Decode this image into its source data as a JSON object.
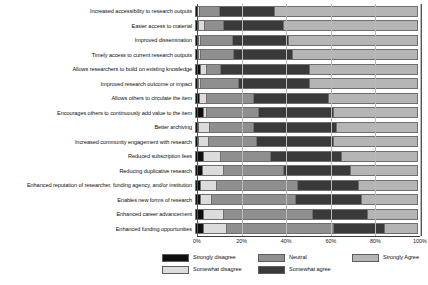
{
  "chart_data": {
    "type": "bar",
    "subtype": "stacked-horizontal-100pct",
    "title": "",
    "subtitle": "",
    "xlabel": "",
    "ylabel": "",
    "xlim": [
      0,
      100
    ],
    "xticks": [
      "0%",
      "20%",
      "40%",
      "60%",
      "80%",
      "100%"
    ],
    "xtick_values": [
      0,
      20,
      40,
      60,
      80,
      100
    ],
    "grid": true,
    "legend_position": "bottom",
    "categories": [
      "Increased accessibility to research outputs",
      "Easier access to material",
      "Improved dissemination",
      "Timely access to current research outputs",
      "Allows researchers to build on existing knowledge",
      "Improved research outcome or impact",
      "Allows others to circulate the item",
      "Encourages others to continuously add value to the item",
      "Better archiving",
      "Increased community engagement with research",
      "Reduced subscription fees",
      "Reducing duplicative research",
      "Enhanced reputation of researcher, funding agency, and/or institution",
      "Enables new forms of research",
      "Enhanced career advancement",
      "Enhanced funding opportunities"
    ],
    "series": [
      {
        "name": "Strongly disagree",
        "color": "#0f0f0f",
        "values": [
          0.5,
          1.0,
          0.8,
          0.8,
          2.0,
          1.0,
          1.2,
          3.0,
          1.0,
          1.0,
          3.2,
          2.5,
          2.0,
          2.0,
          3.0,
          3.0
        ]
      },
      {
        "name": "Somewhat disagree",
        "color": "#dcdcdc",
        "values": [
          0.7,
          2.5,
          1.0,
          1.0,
          2.5,
          1.0,
          3.5,
          1.5,
          5.0,
          4.5,
          7.5,
          9.5,
          7.0,
          5.0,
          9.0,
          10.5
        ]
      },
      {
        "name": "Neutral",
        "color": "#8f8f8f",
        "values": [
          9.0,
          8.5,
          14.5,
          15.0,
          6.5,
          17.0,
          21.0,
          23.5,
          20.0,
          21.5,
          23.0,
          27.5,
          36.5,
          38.0,
          40.5,
          48.5
        ]
      },
      {
        "name": "Somewhat agree",
        "color": "#3a3a3a",
        "values": [
          25.0,
          27.5,
          25.5,
          26.5,
          40.0,
          32.0,
          34.0,
          34.0,
          37.5,
          35.0,
          32.0,
          30.0,
          28.0,
          29.5,
          25.0,
          23.0
        ]
      },
      {
        "name": "Strongly Agree",
        "color": "#b5b5b5",
        "values": [
          64.8,
          60.5,
          58.2,
          56.7,
          49.0,
          49.0,
          40.3,
          38.0,
          36.5,
          38.0,
          34.3,
          30.5,
          26.5,
          25.5,
          22.5,
          15.0
        ]
      }
    ]
  },
  "legend": {
    "entries": [
      {
        "label": "Strongly disagree"
      },
      {
        "label": "Somewhat disagree"
      },
      {
        "label": "Neutral"
      },
      {
        "label": "Somewhat agree"
      },
      {
        "label": "Strongly Agree"
      }
    ]
  }
}
